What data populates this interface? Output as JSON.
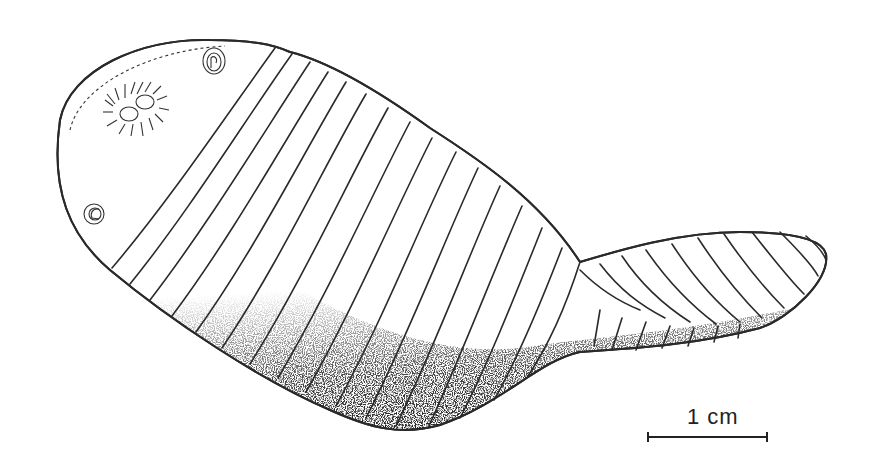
{
  "figure": {
    "line_color": "#2a2a2a",
    "background": "#ffffff"
  },
  "scale_bar": {
    "label": "1 cm"
  }
}
